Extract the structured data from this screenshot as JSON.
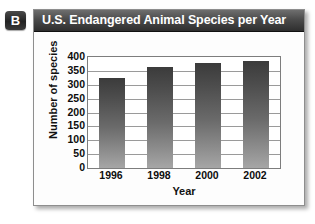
{
  "panel": {
    "badge_label": "B"
  },
  "chart_data": {
    "type": "bar",
    "title": "U.S. Endangered Animal Species per Year",
    "xlabel": "Year",
    "ylabel": "Number of species",
    "categories": [
      "1996",
      "1998",
      "2000",
      "2002"
    ],
    "values": [
      325,
      365,
      378,
      385
    ],
    "series": [
      {
        "name": "Number of species",
        "values": [
          325,
          365,
          378,
          385
        ]
      }
    ],
    "ylim": [
      0,
      400
    ],
    "ytick_labels": [
      "400",
      "350",
      "300",
      "250",
      "200",
      "150",
      "100",
      "50",
      "0"
    ],
    "ytick_values": [
      400,
      350,
      300,
      250,
      200,
      150,
      100,
      50,
      0
    ],
    "ytick_step": 50,
    "grid": true,
    "legend": false,
    "legend_position": "none",
    "bar_color": "#4d4d4d",
    "title_bar_color": "#3a3a3a",
    "title_text_color": "#ffffff"
  }
}
